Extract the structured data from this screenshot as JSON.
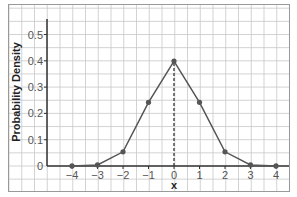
{
  "chart_data": {
    "type": "line",
    "title": "",
    "xlabel": "x",
    "ylabel": "Probability Density",
    "x": [
      -4,
      -3,
      -2,
      -1,
      0,
      1,
      2,
      3,
      4
    ],
    "series": [
      {
        "name": "Probability Density",
        "values": [
          0.0001,
          0.004,
          0.054,
          0.242,
          0.399,
          0.242,
          0.054,
          0.004,
          0.0001
        ]
      }
    ],
    "xticks": [
      "−4",
      "−3",
      "−2",
      "−1",
      "0",
      "1",
      "2",
      "3",
      "4"
    ],
    "yticks": [
      "0",
      "0.1",
      "0.2",
      "0.3",
      "0.4",
      "0.5"
    ],
    "xlim": [
      -5,
      4.3
    ],
    "ylim": [
      0,
      0.55
    ],
    "grid": true,
    "annotations": [
      {
        "type": "dashed-vertical-line",
        "x": 0,
        "from": 0,
        "to": 0.399
      }
    ],
    "colors": {
      "line": "#555555",
      "marker": "#555555",
      "axis": "#333333",
      "grid": "#c8c8c8",
      "border": "#999999"
    }
  }
}
